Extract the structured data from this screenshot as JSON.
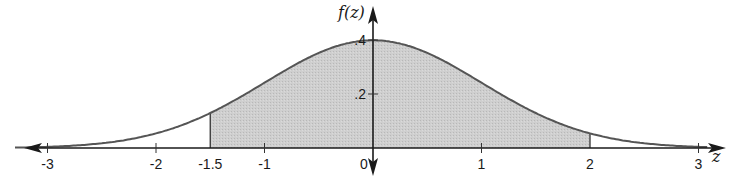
{
  "chart_data": {
    "type": "area",
    "title": "",
    "xlabel": "z",
    "ylabel": "f(z)",
    "curve": "standard normal density",
    "x_ticks": [
      -3,
      -2,
      -1.5,
      -1,
      0,
      1,
      2,
      3
    ],
    "x_tick_labels": [
      "-3",
      "-2",
      "-1.5",
      "-1",
      "0",
      "1",
      "2",
      "3"
    ],
    "y_ticks": [
      0.2,
      0.4
    ],
    "y_tick_labels": [
      ".2",
      ".4"
    ],
    "xlim": [
      -3.3,
      3.1
    ],
    "ylim": [
      0,
      0.44
    ],
    "shaded_region": {
      "from": -1.5,
      "to": 2,
      "color": "#c9c9c9"
    },
    "series": [
      {
        "name": "f(z)",
        "x": [
          -3,
          -2.5,
          -2,
          -1.5,
          -1,
          -0.5,
          0,
          0.5,
          1,
          1.5,
          2,
          2.5,
          3
        ],
        "values": [
          0.0044,
          0.0175,
          0.054,
          0.1295,
          0.242,
          0.352,
          0.399,
          0.352,
          0.242,
          0.1295,
          0.054,
          0.0175,
          0.0044
        ]
      }
    ],
    "grid": false,
    "legend": "none",
    "colors": {
      "curve": "#555555",
      "fill": "#c9c9c9",
      "axis": "#1a1a1a"
    }
  }
}
